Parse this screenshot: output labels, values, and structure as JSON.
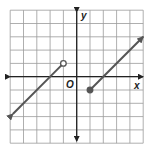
{
  "chart_data": {
    "type": "line",
    "title": "",
    "xlabel": "x",
    "ylabel": "y",
    "origin_label": "O",
    "xlim": [
      -5,
      5
    ],
    "ylim": [
      -5,
      5
    ],
    "grid": true,
    "grid_step": 1,
    "series": [
      {
        "name": "left piece",
        "slope": 1,
        "points": [
          [
            -4.8,
            -2.8
          ],
          [
            -1,
            1
          ]
        ],
        "start": "arrow",
        "end": "open-circle"
      },
      {
        "name": "right piece",
        "slope": 1,
        "points": [
          [
            1,
            -1
          ],
          [
            5,
            3
          ]
        ],
        "start": "closed-circle",
        "end": "arrow"
      }
    ]
  },
  "colors": {
    "grid": "#9a9a9a",
    "axis": "#222222",
    "line": "#555555"
  }
}
